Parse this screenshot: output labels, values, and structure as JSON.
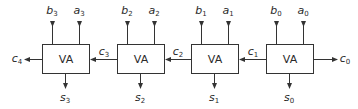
{
  "diagram": {
    "type": "ripple-carry-adder",
    "stroke_color": "#333333",
    "background": "#ffffff",
    "blocks": [
      {
        "label": "VA",
        "x": 42,
        "y": 44,
        "w": 47,
        "h": 29,
        "inputs": [
          {
            "base": "b",
            "sub": "3",
            "x": 52
          },
          {
            "base": "a",
            "sub": "3",
            "x": 79
          }
        ],
        "output": {
          "base": "s",
          "sub": "3",
          "x": 65
        }
      },
      {
        "label": "VA",
        "x": 117,
        "y": 44,
        "w": 47,
        "h": 29,
        "inputs": [
          {
            "base": "b",
            "sub": "2",
            "x": 127
          },
          {
            "base": "a",
            "sub": "2",
            "x": 154
          }
        ],
        "output": {
          "base": "s",
          "sub": "2",
          "x": 140
        }
      },
      {
        "label": "VA",
        "x": 191,
        "y": 44,
        "w": 47,
        "h": 29,
        "inputs": [
          {
            "base": "b",
            "sub": "1",
            "x": 201
          },
          {
            "base": "a",
            "sub": "1",
            "x": 228
          }
        ],
        "output": {
          "base": "s",
          "sub": "1",
          "x": 214
        }
      },
      {
        "label": "VA",
        "x": 266,
        "y": 44,
        "w": 47,
        "h": 29,
        "inputs": [
          {
            "base": "b",
            "sub": "0",
            "x": 276
          },
          {
            "base": "a",
            "sub": "0",
            "x": 303
          }
        ],
        "output": {
          "base": "s",
          "sub": "0",
          "x": 289
        }
      }
    ],
    "carries": [
      {
        "base": "c",
        "sub": "4",
        "label_x": 17,
        "label_y": 59
      },
      {
        "base": "c",
        "sub": "3",
        "label_x": 104,
        "label_y": 52
      },
      {
        "base": "c",
        "sub": "2",
        "label_x": 178,
        "label_y": 52
      },
      {
        "base": "c",
        "sub": "1",
        "label_x": 253,
        "label_y": 52
      },
      {
        "base": "c",
        "sub": "0",
        "label_x": 345,
        "label_y": 59
      }
    ]
  }
}
